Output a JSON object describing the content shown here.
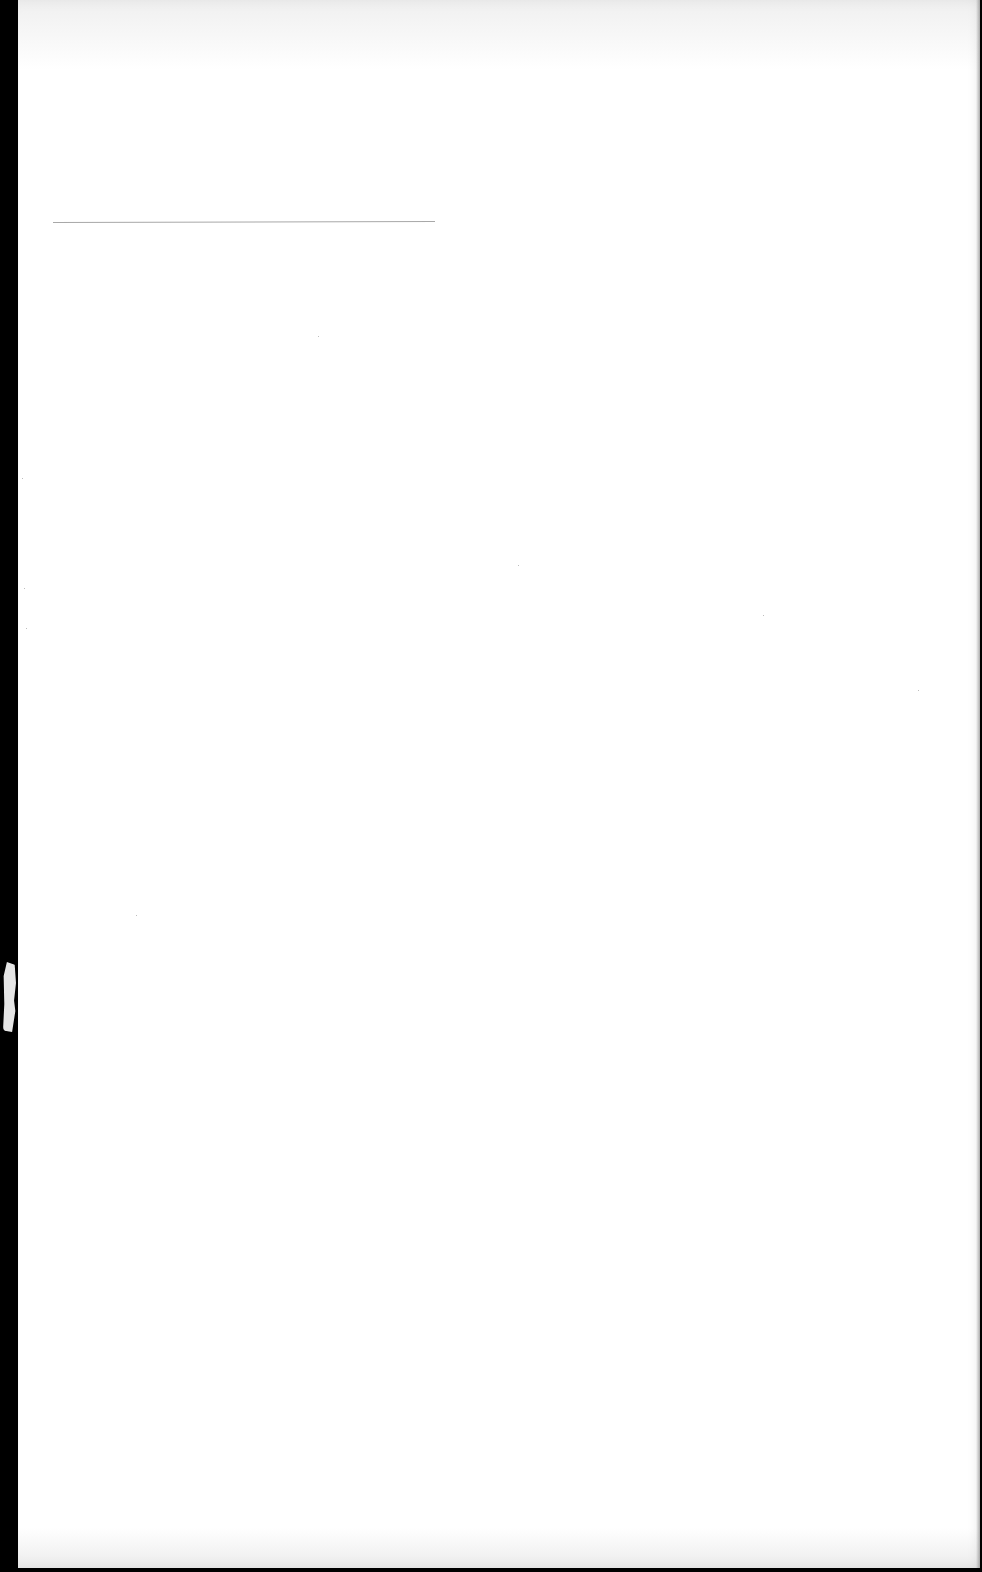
{
  "document": {
    "type": "scanned blank page",
    "text_content": "",
    "elements": {
      "horizontal_rule": {
        "x_start": 53,
        "x_end": 435,
        "y": 222,
        "color": "#a8a8a8"
      }
    },
    "colors": {
      "page_background": "#ffffff",
      "scan_border": "#000000",
      "rule": "#a8a8a8"
    }
  }
}
